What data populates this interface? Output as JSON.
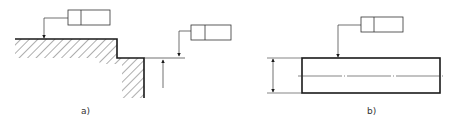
{
  "figures": [
    {
      "id": "a",
      "label": "a)",
      "description": "Stepped surface with hatched material, two tolerance frames pointing at surfaces",
      "tolerance_frames": [
        {
          "cells": [
            "",
            ""
          ]
        },
        {
          "cells": [
            "",
            ""
          ]
        }
      ]
    },
    {
      "id": "b",
      "label": "b)",
      "description": "Rectangular part with center line, dimension arrows, and one tolerance frame",
      "tolerance_frames": [
        {
          "cells": [
            "",
            ""
          ]
        }
      ]
    }
  ],
  "colors": {
    "line": "#1a1a1a",
    "background": "#ffffff"
  }
}
